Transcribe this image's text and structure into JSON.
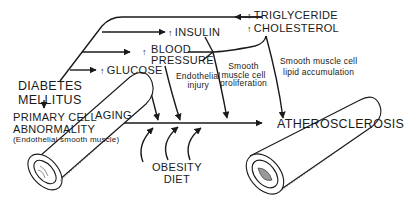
{
  "diagram": {
    "title": "",
    "colors": {
      "ink": "#1a1a1a",
      "background": "#ffffff"
    },
    "arrow_glyph": "↑",
    "nodes": {
      "diabetes": {
        "line1": "DIABETES",
        "line2": "MELLITUS"
      },
      "primary": {
        "line1": "PRIMARY CELL",
        "line2": "ABNORMALITY",
        "line3": "(Endothelial smooth muscle)"
      },
      "glucose": "GLUCOSE",
      "blood_pressure": {
        "line1": "BLOOD",
        "line2": "PRESSURE"
      },
      "insulin": "INSULIN",
      "triglyceride": "TRIGLYCERIDE",
      "cholesterol": "CHOLESTEROL",
      "aging": "AGING",
      "obesity_diet": {
        "line1": "OBESITY",
        "line2": "DIET"
      },
      "atherosclerosis": "ATHEROSCLEROSIS"
    },
    "mechanisms": {
      "endothelial_injury": {
        "line1": "Endothelial",
        "line2": "injury"
      },
      "smc_proliferation": {
        "line1": "Smooth",
        "line2": "muscle cell",
        "line3": "proliferation"
      },
      "smc_lipid": {
        "line1": "Smooth muscle cell",
        "line2": "lipid accumulation"
      }
    },
    "icons": [
      "normal-vessel-icon",
      "atherosclerotic-vessel-icon",
      "up-arrow-icon"
    ]
  }
}
